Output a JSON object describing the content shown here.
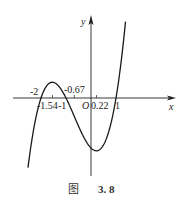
{
  "chart_data": {
    "type": "line",
    "title": "",
    "function": "f(x) = (x+2)(x+1)(x-1) = x^3 + 2x^2 - x - 2",
    "xlabel": "x",
    "ylabel": "y",
    "origin_label": "O",
    "x_tick_labels_above": [
      "-2",
      "-0.67"
    ],
    "x_tick_labels_below": [
      "-1.54",
      "-1",
      "0.22",
      "1"
    ],
    "roots": [
      -2,
      -1,
      1
    ],
    "local_max": {
      "x": -1.54,
      "y": 0.63
    },
    "local_min": {
      "x": 0.22,
      "y": -2.11
    },
    "inflection": {
      "x": -0.67
    },
    "xlim": [
      -2.5,
      3.4
    ],
    "ylim": [
      -3.1,
      3.3
    ],
    "grid": false,
    "legend": null
  },
  "caption": {
    "prefix": "图",
    "number": "3. 8"
  },
  "colors": {
    "curve": "#1a1a1a",
    "axis": "#222222"
  }
}
